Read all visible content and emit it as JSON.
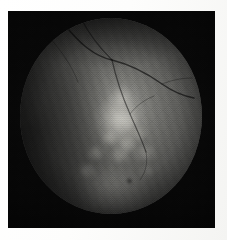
{
  "figure": {
    "kind": "fundus-photograph",
    "modality": "grayscale retinal fundus photograph",
    "caption": "",
    "width_px": 227,
    "height_px": 240
  },
  "colors": {
    "paper": "#fbfbfa",
    "frame_black": "#050505",
    "retina_mid": "#6a6a66",
    "retina_bright": "#d6d5ce",
    "retina_dark": "#1e1e1e",
    "vessel": "#060606"
  },
  "geometry": {
    "paper_margin_left_px": 8,
    "paper_margin_top_px": 11,
    "frame_width_px": 207,
    "frame_height_px": 217,
    "disc_left_px": 12,
    "disc_top_px": 7,
    "disc_width_px": 182,
    "disc_height_px": 196
  },
  "features": {
    "central_lesion_label": "central bright plaque",
    "vessel_label": "retinal vessel arcade",
    "dark_dot_label": "dark focal spot",
    "rim_glow_label": "inferior brighter zone"
  },
  "overlays": {
    "halftone_label": "print halftone texture",
    "scanline_label": "scan banding",
    "vignette_label": "peripheral vignette"
  }
}
